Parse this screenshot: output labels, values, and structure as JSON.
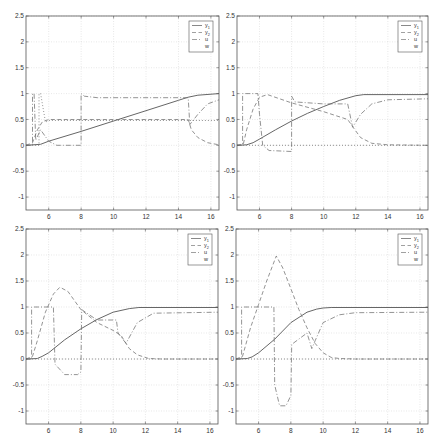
{
  "figure": {
    "layout": "2x2 grid of line plots",
    "style": {
      "axis_color": "#555555",
      "grid_color": "#d8d8d8",
      "line_color": "#555555",
      "dash_color": "#777777"
    }
  },
  "chart_data": [
    {
      "type": "line",
      "panel": "top-left",
      "title": "",
      "xlabel": "",
      "ylabel": "",
      "xlim": [
        4.6,
        16.5
      ],
      "ylim": [
        -1.25,
        2.5
      ],
      "xticks": [
        6,
        8,
        10,
        12,
        14,
        16
      ],
      "yticks": [
        -1,
        -0.5,
        0,
        0.5,
        1,
        1.5,
        2,
        2.5
      ],
      "grid": true,
      "legend": {
        "position": "upper right",
        "entries": [
          "y1",
          "y2",
          "u",
          "w"
        ]
      },
      "series": [
        {
          "name": "y1",
          "style": "solid",
          "x": [
            4.6,
            5.5,
            6.0,
            8.0,
            10.0,
            12.0,
            14.0,
            14.6,
            15.2,
            16.5
          ],
          "y": [
            0,
            0.02,
            0.08,
            0.27,
            0.47,
            0.67,
            0.87,
            0.93,
            0.97,
            1.0
          ]
        },
        {
          "name": "y2",
          "style": "dashed",
          "x": [
            4.6,
            5.0,
            5.3,
            5.6,
            6.0,
            8.0,
            14.6,
            14.8,
            15.2,
            15.8,
            16.5
          ],
          "y": [
            0,
            0.05,
            0.3,
            0.45,
            0.5,
            0.5,
            0.5,
            0.3,
            0.15,
            0.05,
            0.01
          ]
        },
        {
          "name": "u",
          "style": "dashdot",
          "x": [
            4.6,
            5.0,
            5.0,
            5.1,
            5.2,
            5.5,
            6.0,
            6.5,
            8.0,
            8.0,
            8.2,
            9.0,
            14.6,
            14.7,
            15.2,
            15.8,
            16.5
          ],
          "y": [
            0,
            0,
            1,
            1,
            0.1,
            0.3,
            0.08,
            0.0,
            0.0,
            1.0,
            0.95,
            0.92,
            0.92,
            0.4,
            0.6,
            0.8,
            0.88
          ]
        },
        {
          "name": "w",
          "style": "dotted",
          "x": [
            4.6,
            5.4,
            5.4,
            5.5,
            5.8,
            6.0,
            8.0,
            16.5
          ],
          "y": [
            0,
            0,
            1,
            1,
            0.45,
            0.48,
            0.48,
            0.48
          ]
        }
      ]
    },
    {
      "type": "line",
      "panel": "top-right",
      "title": "",
      "xlabel": "",
      "ylabel": "",
      "xlim": [
        4.6,
        16.5
      ],
      "ylim": [
        -1.25,
        2.5
      ],
      "xticks": [
        6,
        8,
        10,
        12,
        14,
        16
      ],
      "yticks": [
        -1,
        -0.5,
        0,
        0.5,
        1,
        1.5,
        2,
        2.5
      ],
      "grid": true,
      "legend": {
        "position": "upper right",
        "entries": [
          "y1",
          "y2",
          "u",
          "w"
        ]
      },
      "series": [
        {
          "name": "y1",
          "style": "solid",
          "x": [
            4.6,
            5.2,
            5.6,
            6.0,
            7.0,
            8.0,
            9.0,
            10.0,
            11.0,
            12.0,
            12.5,
            16.5
          ],
          "y": [
            0,
            0.01,
            0.05,
            0.12,
            0.3,
            0.47,
            0.62,
            0.75,
            0.87,
            0.96,
            0.98,
            0.98
          ]
        },
        {
          "name": "y2",
          "style": "dashed",
          "x": [
            4.6,
            5.0,
            5.2,
            5.6,
            6.0,
            6.5,
            8.0,
            10.0,
            11.5,
            11.9,
            12.3,
            13.0,
            14.0,
            16.5
          ],
          "y": [
            0,
            0.03,
            0.3,
            0.7,
            0.93,
            0.98,
            0.82,
            0.65,
            0.5,
            0.32,
            0.15,
            0.04,
            0.01,
            0
          ]
        },
        {
          "name": "u",
          "style": "dashdot",
          "x": [
            4.6,
            4.95,
            4.95,
            5.0,
            5.9,
            6.0,
            6.2,
            6.6,
            8.0,
            8.0,
            8.2,
            10.0,
            11.5,
            11.8,
            12.3,
            13.0,
            14.0,
            16.5
          ],
          "y": [
            0,
            0,
            1,
            1,
            1,
            0.6,
            0.0,
            -0.1,
            -0.12,
            0.95,
            0.84,
            0.8,
            0.8,
            0.35,
            0.6,
            0.8,
            0.88,
            0.9
          ]
        },
        {
          "name": "w",
          "style": "dotted",
          "x": [
            4.6,
            16.5
          ],
          "y": [
            0,
            0
          ]
        }
      ]
    },
    {
      "type": "line",
      "panel": "bottom-left",
      "title": "",
      "xlabel": "",
      "ylabel": "",
      "xlim": [
        4.6,
        16.5
      ],
      "ylim": [
        -1.25,
        2.5
      ],
      "xticks": [
        6,
        8,
        10,
        12,
        14,
        16
      ],
      "yticks": [
        -1,
        -0.5,
        0,
        0.5,
        1,
        1.5,
        2,
        2.5
      ],
      "grid": true,
      "legend": {
        "position": "upper right",
        "entries": [
          "y1",
          "y2",
          "u",
          "w"
        ]
      },
      "series": [
        {
          "name": "y1",
          "style": "solid",
          "x": [
            4.6,
            5.3,
            5.6,
            6.0,
            7.0,
            8.0,
            9.0,
            10.0,
            11.0,
            11.6,
            16.5
          ],
          "y": [
            0,
            0.01,
            0.05,
            0.12,
            0.37,
            0.58,
            0.76,
            0.9,
            0.97,
            0.99,
            0.99
          ]
        },
        {
          "name": "y2",
          "style": "dashed",
          "x": [
            4.6,
            5.0,
            5.3,
            5.8,
            6.3,
            6.7,
            7.2,
            8.0,
            9.0,
            10.0,
            10.5,
            11.0,
            11.5,
            12.2,
            13.0,
            16.5
          ],
          "y": [
            0,
            0.05,
            0.35,
            0.9,
            1.25,
            1.38,
            1.3,
            0.95,
            0.7,
            0.55,
            0.45,
            0.2,
            0.08,
            0.01,
            0,
            0
          ]
        },
        {
          "name": "u",
          "style": "dashdot",
          "x": [
            4.6,
            4.95,
            4.95,
            5.0,
            6.0,
            6.3,
            6.4,
            7.0,
            7.8,
            8.0,
            8.05,
            9.0,
            10.2,
            10.3,
            10.8,
            11.5,
            12.5,
            16.5
          ],
          "y": [
            0,
            0,
            1,
            1,
            1,
            1,
            -0.1,
            -0.3,
            -0.3,
            -0.25,
            0.95,
            0.75,
            0.75,
            0.5,
            0.3,
            0.7,
            0.88,
            0.9
          ]
        },
        {
          "name": "w",
          "style": "dotted",
          "x": [
            4.6,
            16.5
          ],
          "y": [
            0,
            0
          ]
        }
      ]
    },
    {
      "type": "line",
      "panel": "bottom-right",
      "title": "",
      "xlabel": "",
      "ylabel": "",
      "xlim": [
        4.6,
        16.5
      ],
      "ylim": [
        -1.25,
        2.5
      ],
      "xticks": [
        6,
        8,
        10,
        12,
        14,
        16
      ],
      "yticks": [
        -1,
        -0.5,
        0,
        0.5,
        1,
        1.5,
        2,
        2.5
      ],
      "grid": true,
      "legend": {
        "position": "upper right",
        "entries": [
          "y1",
          "y2",
          "u",
          "w"
        ]
      },
      "series": [
        {
          "name": "y1",
          "style": "solid",
          "x": [
            4.6,
            5.3,
            5.6,
            6.0,
            7.0,
            8.0,
            9.0,
            9.6,
            10.0,
            10.5,
            16.5
          ],
          "y": [
            0,
            0.01,
            0.04,
            0.12,
            0.38,
            0.7,
            0.9,
            0.96,
            0.98,
            0.99,
            0.99
          ]
        },
        {
          "name": "y2",
          "style": "dashed",
          "x": [
            4.6,
            5.0,
            5.5,
            6.0,
            6.5,
            7.1,
            7.5,
            8.0,
            8.5,
            9.0,
            9.5,
            10.0,
            10.5,
            11.0,
            12.0,
            16.5
          ],
          "y": [
            0,
            0.05,
            0.6,
            1.05,
            1.5,
            1.98,
            1.75,
            1.35,
            0.95,
            0.6,
            0.3,
            0.12,
            0.03,
            0.01,
            0,
            0
          ]
        },
        {
          "name": "u",
          "style": "dashdot",
          "x": [
            4.6,
            4.95,
            4.95,
            5.0,
            6.5,
            6.95,
            7.0,
            7.3,
            7.7,
            8.0,
            8.05,
            9.0,
            9.3,
            9.5,
            10.0,
            11.0,
            12.0,
            16.5
          ],
          "y": [
            0,
            0,
            1,
            1,
            1,
            1,
            -0.5,
            -0.9,
            -0.9,
            -0.7,
            0.28,
            0.5,
            0.2,
            0.35,
            0.7,
            0.85,
            0.89,
            0.9
          ]
        },
        {
          "name": "w",
          "style": "dotted",
          "x": [
            4.6,
            16.5
          ],
          "y": [
            0,
            0
          ]
        }
      ]
    }
  ],
  "panels": [
    {
      "box": {
        "left": 26,
        "top": 16,
        "right": 219,
        "bottom": 210
      }
    },
    {
      "box": {
        "left": 237,
        "top": 16,
        "right": 428,
        "bottom": 210
      }
    },
    {
      "box": {
        "left": 26,
        "top": 229,
        "right": 218,
        "bottom": 424
      }
    },
    {
      "box": {
        "left": 236,
        "top": 229,
        "right": 428,
        "bottom": 424
      }
    }
  ],
  "legend_labels": {
    "y1": "y",
    "y1_sub": "1",
    "y2": "y",
    "y2_sub": "2",
    "u": "u",
    "w": "w"
  }
}
